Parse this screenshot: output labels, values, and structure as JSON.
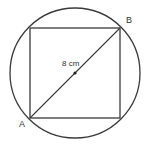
{
  "diagram": {
    "labels": {
      "a": "A",
      "b": "B",
      "diameter": "8 cm"
    },
    "shapes": [
      "circle",
      "inscribed-square",
      "diagonal-AB",
      "center-point"
    ],
    "stroke_color": "#3a3a3a"
  }
}
